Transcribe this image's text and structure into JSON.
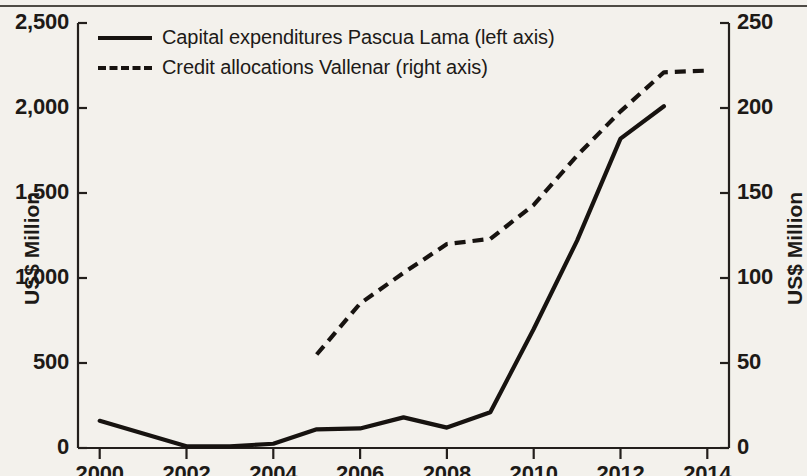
{
  "chart_data": {
    "type": "line",
    "title": "",
    "xlabel": "",
    "ylabel": "US$ Million",
    "y2label": "US$ Million",
    "grid": false,
    "legend_position": "top-left",
    "x": [
      2000,
      2001,
      2002,
      2003,
      2004,
      2005,
      2006,
      2007,
      2008,
      2009,
      2010,
      2011,
      2012,
      2013,
      2014
    ],
    "xlim": [
      1999.5,
      2014.5
    ],
    "xticks": [
      2000,
      2002,
      2004,
      2006,
      2008,
      2010,
      2012,
      2014
    ],
    "xticklabels": [
      "2000",
      "2002",
      "2004",
      "2006",
      "2008",
      "2010",
      "2012",
      "2014"
    ],
    "ylim": [
      0,
      2500
    ],
    "yticks": [
      0,
      500,
      1000,
      1500,
      2000,
      2500
    ],
    "yticklabels": [
      "0",
      "500",
      "1,000",
      "1,500",
      "2,000",
      "2,500"
    ],
    "y2lim": [
      0,
      250
    ],
    "y2ticks": [
      0,
      50,
      100,
      150,
      200,
      250
    ],
    "y2ticklabels": [
      "0",
      "50",
      "100",
      "150",
      "200",
      "250"
    ],
    "series": [
      {
        "name": "Capital expenditures Pascua Lama (left axis)",
        "axis": "left",
        "style": "solid",
        "x": [
          2000,
          2001,
          2002,
          2003,
          2004,
          2005,
          2006,
          2007,
          2008,
          2009,
          2010,
          2011,
          2012,
          2013
        ],
        "values": [
          160,
          85,
          10,
          10,
          25,
          110,
          115,
          180,
          120,
          210,
          700,
          1220,
          1820,
          2010
        ]
      },
      {
        "name": "Credit allocations Vallenar (right axis)",
        "axis": "right",
        "style": "dashed",
        "x": [
          2005,
          2006,
          2007,
          2008,
          2009,
          2010,
          2011,
          2012,
          2013,
          2014
        ],
        "values": [
          55,
          85,
          103,
          120,
          123,
          143,
          172,
          198,
          221,
          222
        ]
      }
    ]
  },
  "legend": {
    "items": [
      {
        "label": "Capital expenditures Pascua Lama (left axis)",
        "style": "solid"
      },
      {
        "label": "Credit allocations Vallenar (right axis)",
        "style": "dashed"
      }
    ]
  },
  "axes": {
    "left_title": "US$ Million",
    "right_title": "US$ Million"
  },
  "colors": {
    "ink": "#171310",
    "paper": "#f3f1ec"
  }
}
